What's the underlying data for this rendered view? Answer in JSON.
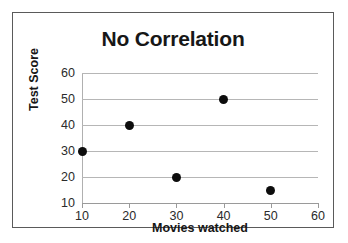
{
  "chart_data": {
    "type": "scatter",
    "title": "No Correlation",
    "xlabel": "Movies watched",
    "ylabel": "Test Score",
    "xlim": [
      10,
      60
    ],
    "ylim": [
      10,
      60
    ],
    "xticks": [
      "10",
      "20",
      "30",
      "40",
      "50",
      "60"
    ],
    "yticks": [
      "10",
      "20",
      "30",
      "40",
      "50",
      "60"
    ],
    "grid": "horizontal",
    "legend": null,
    "series": [
      {
        "name": "Students",
        "marker": "filled-circle",
        "color": "#0d0d0d",
        "points": [
          {
            "x": 10,
            "y": 30
          },
          {
            "x": 20,
            "y": 40
          },
          {
            "x": 30,
            "y": 20
          },
          {
            "x": 40,
            "y": 50
          },
          {
            "x": 50,
            "y": 15
          }
        ]
      }
    ]
  },
  "figure": {
    "border_color": "#5a5a5a",
    "gridline_color": "#b6b6b6",
    "background": "#ffffff"
  }
}
